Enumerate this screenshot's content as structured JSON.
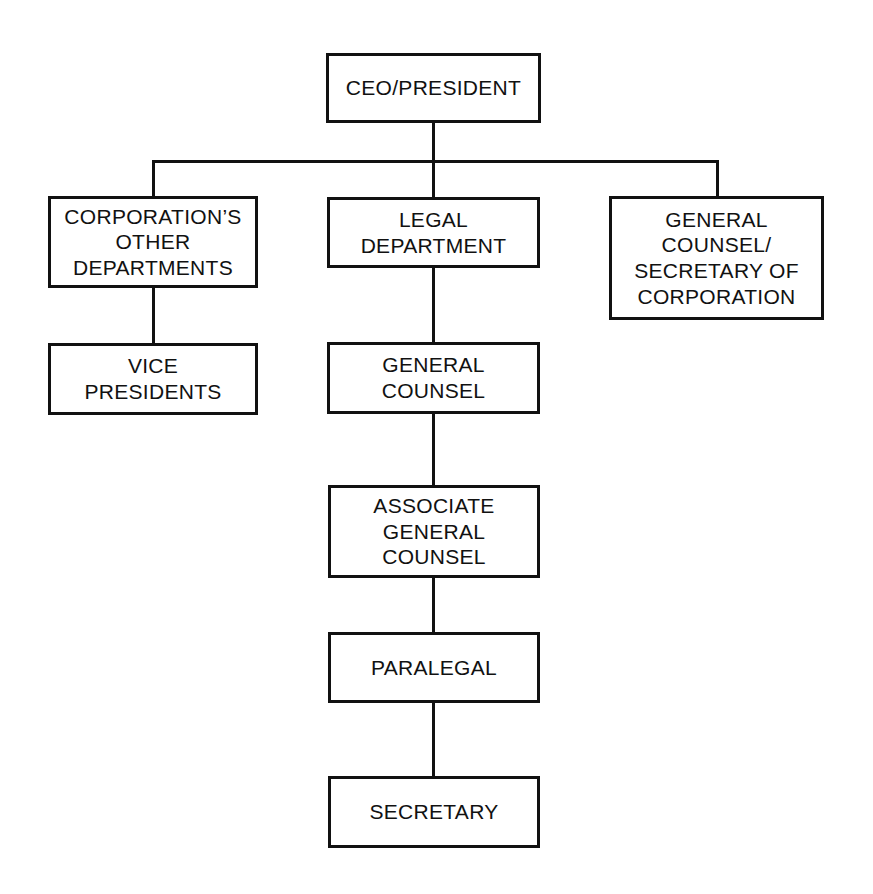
{
  "chart": {
    "type": "org-chart",
    "background_color": "#ffffff",
    "line_color": "#111111",
    "text_color": "#111111",
    "canvas": {
      "width": 873,
      "height": 894
    }
  },
  "nodes": {
    "ceo": {
      "label": "CEO/PRESIDENT",
      "x": 326,
      "y": 53,
      "w": 215,
      "h": 70,
      "level": 0
    },
    "other_departments": {
      "label": "CORPORATION’S\nOTHER\nDEPARTMENTS",
      "x": 48,
      "y": 196,
      "w": 210,
      "h": 92,
      "level": 1
    },
    "legal_department": {
      "label": "LEGAL\nDEPARTMENT",
      "x": 327,
      "y": 197,
      "w": 213,
      "h": 71,
      "level": 1
    },
    "general_counsel_secretary": {
      "label": "GENERAL\nCOUNSEL/\nSECRETARY OF\nCORPORATION",
      "x": 609,
      "y": 196,
      "w": 215,
      "h": 124,
      "level": 1
    },
    "vice_presidents": {
      "label": "VICE\nPRESIDENTS",
      "x": 48,
      "y": 343,
      "w": 210,
      "h": 72,
      "level": 2
    },
    "general_counsel": {
      "label": "GENERAL\nCOUNSEL",
      "x": 327,
      "y": 342,
      "w": 213,
      "h": 72,
      "level": 2
    },
    "associate_general_counsel": {
      "label": "ASSOCIATE\nGENERAL\nCOUNSEL",
      "x": 328,
      "y": 485,
      "w": 212,
      "h": 93,
      "level": 3
    },
    "paralegal": {
      "label": "PARALEGAL",
      "x": 328,
      "y": 632,
      "w": 212,
      "h": 71,
      "level": 4
    },
    "secretary": {
      "label": "SECRETARY",
      "x": 328,
      "y": 776,
      "w": 212,
      "h": 72,
      "level": 5
    }
  },
  "connectors": {
    "ceo_stem": {
      "orientation": "vertical",
      "x": 432,
      "y": 120,
      "length": 43
    },
    "bus": {
      "orientation": "horizontal",
      "x": 152,
      "y": 160,
      "length": 567
    },
    "drop_left": {
      "orientation": "vertical",
      "x": 152,
      "y": 160,
      "length": 38
    },
    "drop_center": {
      "orientation": "vertical",
      "x": 432,
      "y": 160,
      "length": 40
    },
    "drop_right": {
      "orientation": "vertical",
      "x": 716,
      "y": 160,
      "length": 39
    },
    "other_to_vp": {
      "orientation": "vertical",
      "x": 152,
      "y": 286,
      "length": 59
    },
    "legal_to_gc": {
      "orientation": "vertical",
      "x": 432,
      "y": 266,
      "length": 78
    },
    "gc_to_agc": {
      "orientation": "vertical",
      "x": 432,
      "y": 412,
      "length": 75
    },
    "agc_to_paralegal": {
      "orientation": "vertical",
      "x": 432,
      "y": 576,
      "length": 58
    },
    "paralegal_to_secretary": {
      "orientation": "vertical",
      "x": 432,
      "y": 701,
      "length": 77
    }
  },
  "relationships": [
    {
      "from": "ceo",
      "to": "other_departments"
    },
    {
      "from": "ceo",
      "to": "legal_department"
    },
    {
      "from": "ceo",
      "to": "general_counsel_secretary"
    },
    {
      "from": "other_departments",
      "to": "vice_presidents"
    },
    {
      "from": "legal_department",
      "to": "general_counsel"
    },
    {
      "from": "general_counsel",
      "to": "associate_general_counsel"
    },
    {
      "from": "associate_general_counsel",
      "to": "paralegal"
    },
    {
      "from": "paralegal",
      "to": "secretary"
    }
  ]
}
